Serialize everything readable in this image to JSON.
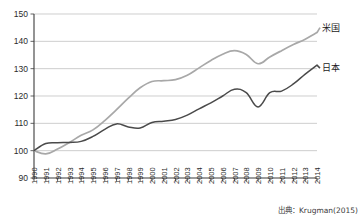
{
  "chart_data": {
    "type": "line",
    "title": "",
    "subtitle": "",
    "xlabel": "",
    "ylabel": "",
    "xlim": [
      1990,
      2014
    ],
    "ylim": [
      90,
      150
    ],
    "yticks": [
      90,
      100,
      110,
      120,
      130,
      140,
      150
    ],
    "grid": true,
    "legend_position": "right",
    "source": "出典：Krugman(2015)",
    "categories": [
      "1990",
      "1991",
      "1992",
      "1993",
      "1994",
      "1995",
      "1996",
      "1997",
      "1998",
      "1999",
      "2000",
      "2001",
      "2002",
      "2003",
      "2004",
      "2005",
      "2006",
      "2007",
      "2008",
      "2009",
      "2010",
      "2011",
      "2012",
      "2013",
      "2014"
    ],
    "series": [
      {
        "name": "米国",
        "color": "#a8a8a8",
        "values": [
          100.0,
          98.8,
          100.6,
          103.0,
          105.6,
          107.6,
          111.0,
          115.0,
          119.2,
          123.0,
          125.3,
          125.6,
          126.0,
          127.6,
          130.3,
          133.0,
          135.3,
          136.6,
          135.2,
          131.8,
          134.3,
          136.6,
          138.8,
          140.8,
          143.2
        ]
      },
      {
        "name": "日本",
        "color": "#4a4a4a",
        "values": [
          100.0,
          102.6,
          102.9,
          103.0,
          103.4,
          105.2,
          107.8,
          109.8,
          108.7,
          108.3,
          110.3,
          110.8,
          111.4,
          113.0,
          115.3,
          117.5,
          120.0,
          122.5,
          121.2,
          116.0,
          121.2,
          121.8,
          124.4,
          128.0,
          131.3
        ]
      }
    ]
  },
  "legend": {
    "items": [
      {
        "label": "米国"
      },
      {
        "label": "日本"
      }
    ]
  },
  "axes": {
    "y_labels": [
      "150",
      "140",
      "130",
      "120",
      "110",
      "100",
      "90"
    ],
    "x_labels": [
      "1990",
      "1991",
      "1992",
      "1993",
      "1994",
      "1995",
      "1996",
      "1997",
      "1998",
      "1999",
      "2000",
      "2001",
      "2002",
      "2003",
      "2004",
      "2005",
      "2006",
      "2007",
      "2008",
      "2009",
      "2010",
      "2011",
      "2012",
      "2013",
      "2014"
    ]
  },
  "footer": {
    "source": "出典：Krugman(2015)"
  }
}
